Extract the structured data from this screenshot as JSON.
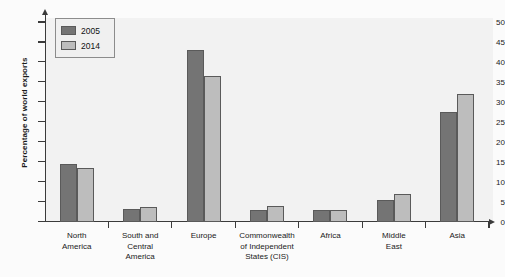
{
  "chart_data": {
    "type": "bar",
    "title": "",
    "subtitle": "",
    "xlabel": "",
    "ylabel": "Percentage of world exports",
    "ylim": [
      0,
      52
    ],
    "yticks": [
      0,
      5,
      10,
      15,
      20,
      25,
      30,
      35,
      40,
      45,
      50
    ],
    "ytick_labels": [
      "0",
      "5",
      "10",
      "15",
      "20",
      "25",
      "30",
      "35",
      "40",
      "45",
      "50"
    ],
    "grid": false,
    "legend_position": "top-left",
    "categories": [
      "North America",
      "South and Central America",
      "Europe",
      "Commonwealth of Independent States (CIS)",
      "Africa",
      "Middle East",
      "Asia"
    ],
    "category_lines": [
      [
        "North",
        "America"
      ],
      [
        "South and",
        "Central",
        "America"
      ],
      [
        "Europe"
      ],
      [
        "Commonwealth",
        "of Independent",
        "States (CIS)"
      ],
      [
        "Africa"
      ],
      [
        "Middle",
        "East"
      ],
      [
        "Asia"
      ]
    ],
    "series": [
      {
        "name": "2005",
        "color": "#747474",
        "values": [
          14.3,
          3.1,
          43.0,
          3.0,
          3.0,
          5.3,
          27.5
        ]
      },
      {
        "name": "2014",
        "color": "#bdbdbd",
        "values": [
          13.4,
          3.6,
          36.5,
          4.0,
          3.0,
          6.8,
          32.0
        ]
      }
    ]
  },
  "legend": {
    "items": [
      {
        "label": "2005",
        "color": "#747474"
      },
      {
        "label": "2014",
        "color": "#bdbdbd"
      }
    ]
  },
  "axes": {
    "y_title": "Percentage of world exports"
  },
  "colors": {
    "series_2005": "#747474",
    "series_2014": "#bdbdbd",
    "axis": "#3b3b3b",
    "plot_background": "#f2f2f2",
    "page_background": "#fbfbfb"
  }
}
